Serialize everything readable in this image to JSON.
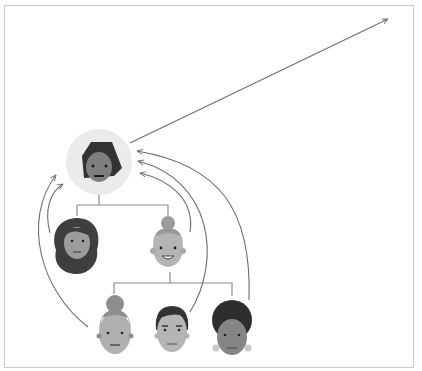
{
  "diagram": {
    "type": "hierarchy-with-referral-arrows",
    "colors": {
      "frame": "#c9c9c9",
      "line": "#8a8a8a",
      "arrow": "#6e6e6e",
      "highlight_circle": "#ebebeb",
      "skin_light": "#b8b8b8",
      "skin_mid": "#9c9c9c",
      "skin_dark": "#7a7a7a",
      "hair_dark": "#3a3a3a",
      "hair_light": "#9a9a9a",
      "feature": "#2a2a2a"
    },
    "nodes": [
      {
        "id": "root",
        "label": "top-person",
        "highlighted": true
      },
      {
        "id": "child-left",
        "label": "woman-curly-hair"
      },
      {
        "id": "child-right",
        "label": "smiling-person-bun"
      },
      {
        "id": "grandchild-1",
        "label": "woman-bun"
      },
      {
        "id": "grandchild-2",
        "label": "man-short-hair"
      },
      {
        "id": "grandchild-3",
        "label": "woman-afro-earrings"
      }
    ],
    "edges": [
      {
        "from": "root",
        "to": "child-left"
      },
      {
        "from": "root",
        "to": "child-right"
      },
      {
        "from": "child-right",
        "to": "grandchild-1"
      },
      {
        "from": "child-right",
        "to": "grandchild-2"
      },
      {
        "from": "child-right",
        "to": "grandchild-3"
      }
    ],
    "arrows": [
      {
        "from": "root",
        "to": "outside-top-right"
      },
      {
        "from": "child-left",
        "to": "root"
      },
      {
        "from": "grandchild-1",
        "to": "root"
      },
      {
        "from": "child-right",
        "to": "root"
      },
      {
        "from": "grandchild-2",
        "to": "root"
      },
      {
        "from": "grandchild-3",
        "to": "root"
      }
    ]
  }
}
